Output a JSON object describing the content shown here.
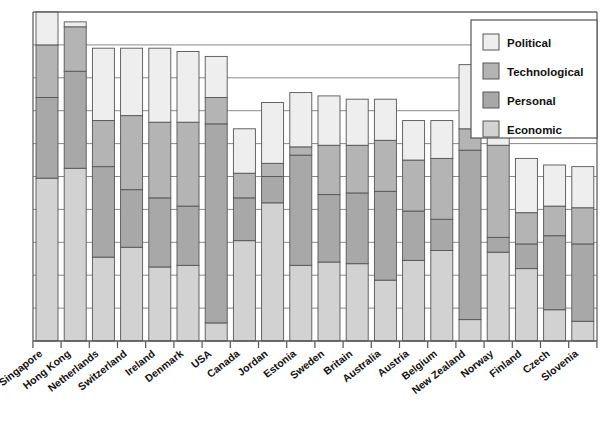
{
  "chart_data": {
    "type": "bar",
    "subtype": "stacked-vertical",
    "title": "",
    "subtitle": "",
    "xlabel": "",
    "ylabel": "",
    "ylim": [
      0,
      100
    ],
    "grid": true,
    "gridlines": [
      0,
      10,
      20,
      30,
      40,
      50,
      60,
      70,
      80,
      90,
      100
    ],
    "axis_tick_labels_shown": false,
    "legend_position": "top-right",
    "legend_entries": [
      {
        "label": "Political",
        "color": "#eeeeee"
      },
      {
        "label": "Technological",
        "color": "#b4b4b4"
      },
      {
        "label": "Personal",
        "color": "#a8a8a8"
      },
      {
        "label": "Economic",
        "color": "#d2d2d2"
      }
    ],
    "stack_order_bottom_to_top": [
      "Economic",
      "Personal",
      "Technological",
      "Political"
    ],
    "categories": [
      "Singapore",
      "Hong Kong",
      "Netherlands",
      "Switzerland",
      "Ireland",
      "Denmark",
      "USA",
      "Canada",
      "Jordan",
      "Estonia",
      "Sweden",
      "Britain",
      "Australia",
      "Austria",
      "Belgium",
      "New Zealand",
      "Norway",
      "Finland",
      "Czech",
      "Slovenia"
    ],
    "series": [
      {
        "name": "Economic",
        "color": "#d2d2d2",
        "values": [
          49.5,
          52.5,
          25.5,
          28.5,
          22.5,
          23.0,
          5.5,
          30.5,
          42.0,
          23.0,
          24.0,
          23.5,
          18.5,
          24.5,
          27.5,
          6.5,
          27.0,
          22.0,
          9.5,
          6.0
        ]
      },
      {
        "name": "Personal",
        "color": "#a8a8a8",
        "values": [
          24.5,
          29.5,
          27.5,
          17.5,
          21.0,
          18.0,
          60.5,
          13.0,
          8.0,
          33.5,
          20.5,
          21.5,
          27.0,
          15.0,
          9.5,
          51.5,
          4.5,
          7.5,
          22.5,
          23.5
        ]
      },
      {
        "name": "Technological",
        "color": "#b4b4b4",
        "values": [
          16.0,
          13.5,
          14.0,
          22.5,
          23.0,
          25.5,
          8.0,
          7.5,
          4.0,
          2.5,
          15.0,
          14.5,
          15.5,
          15.5,
          18.5,
          6.5,
          28.0,
          9.5,
          9.0,
          11.0
        ]
      },
      {
        "name": "Political",
        "color": "#eeeeee",
        "values": [
          10.0,
          1.5,
          22.0,
          20.5,
          22.5,
          21.5,
          12.5,
          13.5,
          18.5,
          16.5,
          15.0,
          14.0,
          12.5,
          12.0,
          11.5,
          19.5,
          27.5,
          16.5,
          12.5,
          12.5
        ]
      }
    ],
    "totals": [
      100.0,
      97.0,
      89.0,
      89.0,
      89.0,
      88.0,
      86.5,
      64.5,
      72.5,
      75.5,
      74.5,
      73.5,
      73.5,
      67.0,
      67.0,
      84.0,
      87.0,
      55.5,
      53.5,
      53.0
    ]
  },
  "plot": {
    "left": 33,
    "right": 597,
    "top": 12,
    "bottom": 341,
    "bar_width": 22,
    "bar_pitch": 28.2,
    "first_bar_center": 47
  },
  "legend_box": {
    "x": 471,
    "y": 20,
    "width": 126,
    "height": 118
  },
  "colors": {
    "background": "#ffffff",
    "axis": "#555555",
    "gridline": "#8a8a8a",
    "bar_stroke": "#555555",
    "text": "#111111"
  }
}
